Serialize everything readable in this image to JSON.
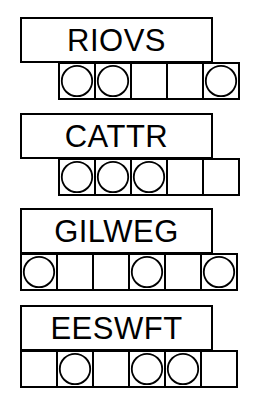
{
  "worksheet": {
    "title": "Word and Circle Marker Worksheet",
    "background_color": "#ffffff",
    "line_color": "#000000",
    "fill_color": "#ffffff",
    "groups": [
      {
        "id": "group-1",
        "word": "RIOVS",
        "word_box": {
          "x": 20,
          "y": 17,
          "width": 193,
          "height": 46
        },
        "cell_row": {
          "x": 58,
          "y": 62,
          "cell_size": 38,
          "count": 5
        },
        "cells": [
          {
            "index": 0,
            "marker": "circle"
          },
          {
            "index": 1,
            "marker": "circle"
          },
          {
            "index": 2,
            "marker": "none"
          },
          {
            "index": 3,
            "marker": "none"
          },
          {
            "index": 4,
            "marker": "circle"
          }
        ]
      },
      {
        "id": "group-2",
        "word": "CATTR",
        "word_box": {
          "x": 20,
          "y": 113,
          "width": 193,
          "height": 46
        },
        "cell_row": {
          "x": 58,
          "y": 158,
          "cell_size": 38,
          "count": 5
        },
        "cells": [
          {
            "index": 0,
            "marker": "circle"
          },
          {
            "index": 1,
            "marker": "circle"
          },
          {
            "index": 2,
            "marker": "circle"
          },
          {
            "index": 3,
            "marker": "none"
          },
          {
            "index": 4,
            "marker": "none"
          }
        ]
      },
      {
        "id": "group-3",
        "word": "GILWEG",
        "word_box": {
          "x": 20,
          "y": 208,
          "width": 193,
          "height": 46
        },
        "cell_row": {
          "x": 20,
          "y": 253,
          "cell_size": 38,
          "count": 6
        },
        "cells": [
          {
            "index": 0,
            "marker": "circle"
          },
          {
            "index": 1,
            "marker": "none"
          },
          {
            "index": 2,
            "marker": "none"
          },
          {
            "index": 3,
            "marker": "circle"
          },
          {
            "index": 4,
            "marker": "none"
          },
          {
            "index": 5,
            "marker": "circle"
          }
        ]
      },
      {
        "id": "group-4",
        "word": "EESWFT",
        "word_box": {
          "x": 20,
          "y": 305,
          "width": 193,
          "height": 46
        },
        "cell_row": {
          "x": 20,
          "y": 350,
          "cell_size": 38,
          "count": 6
        },
        "cells": [
          {
            "index": 0,
            "marker": "none"
          },
          {
            "index": 1,
            "marker": "circle"
          },
          {
            "index": 2,
            "marker": "none"
          },
          {
            "index": 3,
            "marker": "circle"
          },
          {
            "index": 4,
            "marker": "circle"
          },
          {
            "index": 5,
            "marker": "none"
          }
        ]
      }
    ]
  }
}
